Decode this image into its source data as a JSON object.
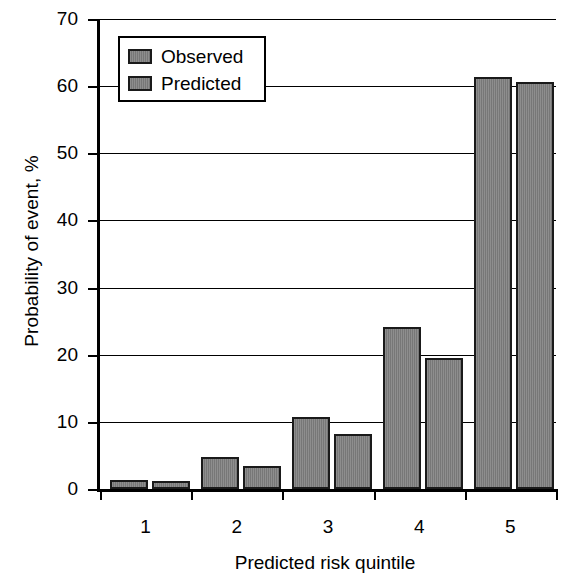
{
  "chart_data": {
    "type": "bar",
    "title": "",
    "xlabel": "Predicted risk quintile",
    "ylabel": "Probability of event, %",
    "categories": [
      "1",
      "2",
      "3",
      "4",
      "5"
    ],
    "series": [
      {
        "name": "Observed",
        "values": [
          1.3,
          4.8,
          10.7,
          24.1,
          61.4
        ]
      },
      {
        "name": "Predicted",
        "values": [
          1.2,
          3.5,
          8.2,
          19.5,
          60.6
        ]
      }
    ],
    "ylim": [
      0,
      70
    ],
    "yticks": [
      0,
      10,
      20,
      30,
      40,
      50,
      60,
      70
    ],
    "ytick_labels": [
      "0",
      "10",
      "20",
      "30",
      "40",
      "50",
      "60",
      "70"
    ],
    "xtick_labels": [
      "1",
      "2",
      "3",
      "4",
      "5"
    ],
    "grid": "horizontal",
    "legend_position": "top-left",
    "colors": {
      "bar_fill": "#7d7d7d",
      "bar_edge": "#1a1a1a",
      "axis": "#000000",
      "background": "#ffffff"
    }
  },
  "legend": {
    "items": [
      {
        "label": "Observed"
      },
      {
        "label": "Predicted"
      }
    ]
  }
}
